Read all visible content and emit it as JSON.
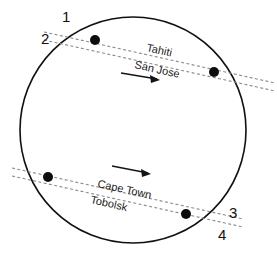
{
  "figure": {
    "globe": {
      "center_x": 133,
      "center_y": 130,
      "radius": 113,
      "stroke_color": "#111111"
    },
    "tracks": [
      {
        "id": "upper-track",
        "labels": [
          "Tahiti",
          "San Jose"
        ],
        "label_top": "Tahiti",
        "label_bottom": "San Jose",
        "direction": "eastward",
        "dash_color": "#8a8a8a"
      },
      {
        "id": "lower-track",
        "labels": [
          "Cape Town",
          "Tobolsk"
        ],
        "label_top": "Cape Town",
        "label_bottom": "Tobolsk",
        "direction": "eastward",
        "dash_color": "#8a8a8a"
      }
    ],
    "crossing_labels": [
      {
        "text": "1",
        "x": 62,
        "y": 22
      },
      {
        "text": "2",
        "x": 41,
        "y": 44
      },
      {
        "text": "3",
        "x": 229,
        "y": 218
      },
      {
        "text": "4",
        "x": 218,
        "y": 240
      }
    ],
    "satellites": [
      {
        "name": "upper-left-satellite",
        "x": 95,
        "y": 40,
        "r": 5
      },
      {
        "name": "upper-right-satellite",
        "x": 214,
        "y": 72,
        "r": 5
      },
      {
        "name": "lower-left-satellite",
        "x": 48,
        "y": 177,
        "r": 5
      },
      {
        "name": "lower-right-satellite",
        "x": 186,
        "y": 214,
        "r": 5
      }
    ],
    "arrows": [
      {
        "name": "upper-direction-arrow",
        "x1": 121,
        "y1": 73,
        "x2": 160,
        "y2": 80
      },
      {
        "name": "lower-direction-arrow",
        "x1": 112,
        "y1": 166,
        "x2": 151,
        "y2": 174
      }
    ]
  }
}
